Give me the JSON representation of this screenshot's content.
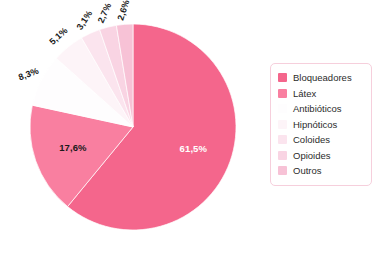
{
  "chart_data": {
    "type": "pie",
    "title": "",
    "subtitle": "",
    "xlabel": "",
    "ylabel": "",
    "grid": false,
    "legend_position": "right",
    "value_suffix": "%",
    "decimal_separator": ",",
    "start_angle_deg": 0,
    "direction": "clockwise",
    "categories": [
      "Bloqueadores",
      "Látex",
      "Antibióticos",
      "Hipnóticos",
      "Coloides",
      "Opioides",
      "Outros"
    ],
    "values": [
      61.5,
      17.6,
      8.3,
      5.1,
      3.1,
      2.7,
      2.6
    ],
    "labels": [
      "61,5%",
      "17,6%",
      "8,3%",
      "5,1%",
      "3,1%",
      "2,7%",
      "2,6%"
    ],
    "colors": [
      "#f4668c",
      "#f97fa0",
      "#fefdfe",
      "#fdf4f8",
      "#fbe4ee",
      "#f9d4e3",
      "#f7c2d6"
    ],
    "slices": [
      {
        "name": "Bloqueadores",
        "value": 61.5,
        "label": "61,5%",
        "color": "#f4668c",
        "label_color": "#ffffff",
        "label_position": "inside",
        "label_rotation": 0
      },
      {
        "name": "Látex",
        "value": 17.6,
        "label": "17,6%",
        "color": "#f97fa0",
        "label_color": "#1a1a1a",
        "label_position": "inside",
        "label_rotation": 0
      },
      {
        "name": "Antibióticos",
        "value": 8.3,
        "label": "8,3%",
        "color": "#fefdfe",
        "label_color": "#1a1a1a",
        "label_position": "outside",
        "label_rotation": -20
      },
      {
        "name": "Hipnóticos",
        "value": 5.1,
        "label": "5,1%",
        "color": "#fdf4f8",
        "label_color": "#1a1a1a",
        "label_position": "outside",
        "label_rotation": -42
      },
      {
        "name": "Coloides",
        "value": 3.1,
        "label": "3,1%",
        "color": "#fbe4ee",
        "label_color": "#1a1a1a",
        "label_position": "outside",
        "label_rotation": -57
      },
      {
        "name": "Opioides",
        "value": 2.7,
        "label": "2,7%",
        "color": "#f9d4e3",
        "label_color": "#1a1a1a",
        "label_position": "outside",
        "label_rotation": -66
      },
      {
        "name": "Outros",
        "value": 2.6,
        "label": "2,6%",
        "color": "#f7c2d6",
        "label_color": "#1a1a1a",
        "label_position": "outside",
        "label_rotation": -72
      }
    ]
  },
  "legend": {
    "border_color": "#f6cfdc",
    "items": [
      {
        "label": "Bloqueadores",
        "color": "#f4668c"
      },
      {
        "label": "Látex",
        "color": "#f97fa0"
      },
      {
        "label": "Antibióticos",
        "color": "#fefdfe"
      },
      {
        "label": "Hipnóticos",
        "color": "#fdf4f8"
      },
      {
        "label": "Coloides",
        "color": "#fbe4ee"
      },
      {
        "label": "Opioides",
        "color": "#f9d4e3"
      },
      {
        "label": "Outros",
        "color": "#f7c2d6"
      }
    ]
  },
  "geometry": {
    "center_x": 133,
    "center_y": 127,
    "radius": 103
  }
}
